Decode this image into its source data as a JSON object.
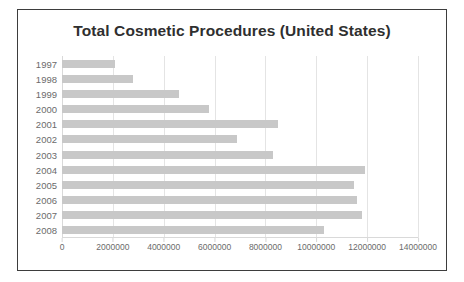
{
  "chart_data": {
    "type": "bar",
    "orientation": "horizontal",
    "title": "Total Cosmetic Procedures (United States)",
    "xlabel": "",
    "ylabel": "",
    "categories": [
      "1997",
      "1998",
      "1999",
      "2000",
      "2001",
      "2002",
      "2003",
      "2004",
      "2005",
      "2006",
      "2007",
      "2008"
    ],
    "values": [
      2100000,
      2800000,
      4600000,
      5800000,
      8500000,
      6900000,
      8300000,
      11900000,
      11500000,
      11600000,
      11800000,
      10300000
    ],
    "series": [
      {
        "name": "Total Cosmetic Procedures",
        "values": [
          2100000,
          2800000,
          4600000,
          5800000,
          8500000,
          6900000,
          8300000,
          11900000,
          11500000,
          11600000,
          11800000,
          10300000
        ]
      }
    ],
    "xlim": [
      0,
      14000000
    ],
    "xticks": [
      0,
      2000000,
      4000000,
      6000000,
      8000000,
      10000000,
      12000000,
      14000000
    ],
    "xtick_labels": [
      "0",
      "2000000",
      "4000000",
      "6000000",
      "8000000",
      "10000000",
      "12000000",
      "14000000"
    ],
    "grid": true,
    "grid_axis": "x",
    "legend": false,
    "bar_color": "#c8c8c8",
    "grid_color": "#e4e4e4",
    "title_color": "#2f2f2f",
    "label_color": "#6b6b6b",
    "frame_color": "#3d3d3d",
    "background": "#ffffff"
  }
}
